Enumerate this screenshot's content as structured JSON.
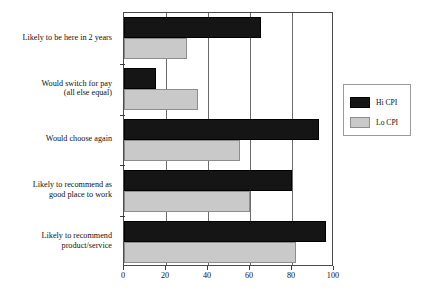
{
  "figure": {
    "caption": ""
  },
  "legend": {
    "position": "right",
    "entries": [
      {
        "label": "Hi CPI",
        "color": "#151515",
        "key": "hi"
      },
      {
        "label": "Lo CPI",
        "color": "#c9c9c9",
        "key": "lo"
      }
    ]
  },
  "chart_data": {
    "type": "bar",
    "orientation": "horizontal",
    "title": "",
    "xlabel": "",
    "ylabel": "",
    "xlim": [
      0,
      100
    ],
    "ylim": [
      0,
      5
    ],
    "grid": true,
    "xticks": [
      0,
      20,
      40,
      60,
      80,
      100
    ],
    "xticklabels": [
      "0",
      "20",
      "40",
      "60",
      "80",
      "100"
    ],
    "categories": [
      "Likely to be here in 2 years",
      "Would switch for pay\n(all else equal)",
      "Would choose again",
      "Likely to recommend as\ngood place to work",
      "Likely to recommend\nproduct/service"
    ],
    "series": [
      {
        "name": "Hi CPI",
        "color": "#151515",
        "values": [
          65,
          15,
          93,
          80,
          96
        ]
      },
      {
        "name": "Lo CPI",
        "color": "#c9c9c9",
        "values": [
          30,
          35,
          55,
          60,
          82
        ]
      }
    ]
  }
}
